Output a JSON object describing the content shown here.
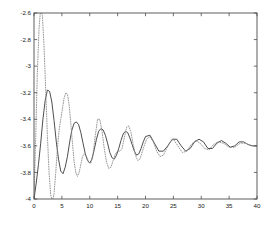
{
  "chart_data": {
    "type": "line",
    "title": "",
    "xlabel": "",
    "ylabel": "",
    "xlim": [
      0,
      40
    ],
    "ylim": [
      -4,
      -2.6
    ],
    "xticks": [
      0,
      5,
      10,
      15,
      20,
      25,
      30,
      35,
      40
    ],
    "xticklabels": [
      "0",
      "5",
      "10",
      "15",
      "20",
      "25",
      "30",
      "35",
      "40"
    ],
    "yticks": [
      -4,
      -3.8,
      -3.6,
      -3.4,
      -3.2,
      -3,
      -2.8,
      -2.6
    ],
    "yticklabels": [
      "-4",
      "-3.8",
      "-3.6",
      "-3.4",
      "-3.2",
      "-3",
      "-2.8",
      "-2.6"
    ],
    "grid": false,
    "legend": null,
    "box": true,
    "tick_direction": "in",
    "background_color": "#ffffff",
    "axis_color": "#4d4d4d",
    "series": [
      {
        "name": "solid-curve",
        "style": "solid",
        "color": "#3a3a3a",
        "linewidth": 0.9,
        "x": [
          0,
          0.4,
          0.8,
          1.2,
          1.6,
          2.0,
          2.4,
          2.8,
          3.2,
          3.6,
          4.0,
          4.4,
          4.8,
          5.2,
          5.6,
          6.0,
          6.4,
          6.8,
          7.2,
          7.6,
          8.0,
          8.4,
          8.8,
          9.2,
          9.6,
          10.0,
          10.4,
          10.8,
          11.2,
          11.6,
          12.0,
          12.4,
          12.8,
          13.2,
          13.6,
          14.0,
          14.4,
          14.8,
          15.2,
          15.6,
          16.0,
          16.4,
          16.8,
          17.2,
          17.6,
          18.0,
          18.4,
          18.8,
          19.2,
          19.6,
          20.0,
          20.8,
          21.6,
          22.4,
          23.2,
          24.0,
          24.8,
          25.6,
          26.4,
          27.2,
          28.0,
          28.8,
          29.6,
          30.4,
          31.2,
          32.0,
          32.8,
          33.6,
          34.4,
          35.2,
          36.0,
          36.8,
          37.6,
          38.4,
          39.2,
          40.0
        ],
        "y": [
          -4.0,
          -3.88,
          -3.74,
          -3.58,
          -3.4,
          -3.26,
          -3.18,
          -3.19,
          -3.27,
          -3.41,
          -3.57,
          -3.7,
          -3.79,
          -3.81,
          -3.76,
          -3.68,
          -3.57,
          -3.48,
          -3.43,
          -3.42,
          -3.44,
          -3.5,
          -3.58,
          -3.66,
          -3.71,
          -3.73,
          -3.7,
          -3.63,
          -3.55,
          -3.49,
          -3.47,
          -3.48,
          -3.52,
          -3.58,
          -3.65,
          -3.69,
          -3.7,
          -3.67,
          -3.62,
          -3.56,
          -3.51,
          -3.49,
          -3.5,
          -3.54,
          -3.59,
          -3.64,
          -3.67,
          -3.66,
          -3.62,
          -3.57,
          -3.53,
          -3.52,
          -3.58,
          -3.64,
          -3.64,
          -3.6,
          -3.55,
          -3.55,
          -3.6,
          -3.64,
          -3.62,
          -3.57,
          -3.55,
          -3.57,
          -3.62,
          -3.62,
          -3.58,
          -3.56,
          -3.58,
          -3.61,
          -3.6,
          -3.57,
          -3.57,
          -3.59,
          -3.6,
          -3.6
        ]
      },
      {
        "name": "dotted-curve",
        "style": "dotted",
        "color": "#8c8c8c",
        "linewidth": 0.9,
        "x": [
          0,
          0.3,
          0.6,
          0.9,
          1.2,
          1.5,
          1.8,
          2.1,
          2.4,
          2.7,
          3.0,
          3.3,
          3.6,
          3.9,
          4.2,
          4.5,
          4.8,
          5.1,
          5.4,
          5.7,
          6.0,
          6.3,
          6.6,
          6.9,
          7.2,
          7.5,
          7.8,
          8.1,
          8.4,
          8.7,
          9.0,
          9.4,
          9.8,
          10.2,
          10.6,
          11.0,
          11.4,
          11.8,
          12.2,
          12.6,
          13.0,
          13.4,
          13.8,
          14.2,
          14.6,
          15.0,
          15.4,
          15.8,
          16.2,
          16.6,
          17.0,
          17.4,
          17.8,
          18.2,
          18.6,
          19.0,
          19.6,
          20.2,
          20.8,
          21.4,
          22.0,
          22.6,
          23.2,
          23.8,
          24.4,
          25.0,
          25.8,
          26.6,
          27.4,
          28.2,
          29.0,
          29.8,
          30.6,
          31.4,
          32.2,
          33.0,
          34.0,
          35.0,
          36.0,
          37.0,
          38.0,
          39.0,
          40.0
        ],
        "y": [
          -4.0,
          -3.55,
          -3.05,
          -2.72,
          -2.56,
          -2.62,
          -2.85,
          -3.18,
          -3.52,
          -3.8,
          -3.97,
          -4.02,
          -3.96,
          -3.8,
          -3.62,
          -3.48,
          -3.4,
          -3.32,
          -3.24,
          -3.2,
          -3.21,
          -3.29,
          -3.43,
          -3.58,
          -3.72,
          -3.8,
          -3.83,
          -3.8,
          -3.74,
          -3.68,
          -3.66,
          -3.68,
          -3.72,
          -3.73,
          -3.66,
          -3.52,
          -3.4,
          -3.4,
          -3.49,
          -3.62,
          -3.72,
          -3.77,
          -3.76,
          -3.71,
          -3.66,
          -3.64,
          -3.64,
          -3.62,
          -3.54,
          -3.46,
          -3.45,
          -3.5,
          -3.59,
          -3.67,
          -3.71,
          -3.7,
          -3.62,
          -3.55,
          -3.53,
          -3.57,
          -3.64,
          -3.68,
          -3.67,
          -3.62,
          -3.57,
          -3.55,
          -3.6,
          -3.65,
          -3.64,
          -3.59,
          -3.56,
          -3.58,
          -3.62,
          -3.63,
          -3.59,
          -3.57,
          -3.58,
          -3.61,
          -3.61,
          -3.58,
          -3.58,
          -3.6,
          -3.6
        ]
      }
    ]
  },
  "figure": {
    "plot_left_px": 34,
    "plot_right_px": 257,
    "plot_top_px": 13,
    "plot_bottom_px": 199
  }
}
